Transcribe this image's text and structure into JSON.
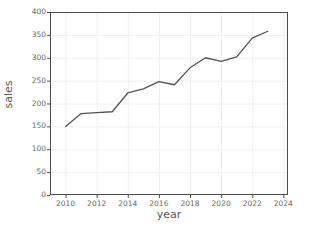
{
  "chart_data": {
    "type": "line",
    "title": "",
    "xlabel": "year",
    "ylabel": "sales",
    "x": [
      2010,
      2011,
      2012,
      2013,
      2014,
      2015,
      2016,
      2017,
      2018,
      2019,
      2020,
      2021,
      2022,
      2023
    ],
    "values": [
      150,
      178,
      180,
      182,
      223,
      232,
      248,
      241,
      278,
      300,
      292,
      302,
      343,
      358
    ],
    "series": [
      {
        "name": "sales",
        "values": [
          150,
          178,
          180,
          182,
          223,
          232,
          248,
          241,
          278,
          300,
          292,
          302,
          343,
          358
        ],
        "color": "#535353"
      }
    ],
    "xlim": [
      2009,
      2024.3
    ],
    "ylim": [
      0,
      400
    ],
    "xticks": [
      2010,
      2012,
      2014,
      2016,
      2018,
      2020,
      2022,
      2024
    ],
    "xtick_labels": [
      "2010",
      "2012",
      "2014",
      "2016",
      "2018",
      "2020",
      "2022",
      "2024"
    ],
    "yticks": [
      0,
      50,
      100,
      150,
      200,
      250,
      300,
      350,
      400
    ],
    "ytick_labels": [
      "0",
      "50",
      "100",
      "150",
      "200",
      "250",
      "300",
      "350",
      "400"
    ],
    "grid": true,
    "grid_color": "#f0f0f0",
    "legend": false,
    "legend_position": "none",
    "line_color": "#535353",
    "line_width": 1.3,
    "markers": false,
    "axis_color": "#4d4d4d",
    "tick_label_color": "#6b6b6b",
    "background": "#ffffff"
  }
}
